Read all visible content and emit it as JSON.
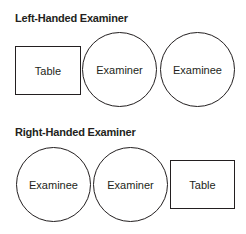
{
  "sections": [
    {
      "title": "Left-Handed Examiner",
      "items": [
        {
          "label": "Table",
          "shape": "rectangle"
        },
        {
          "label": "Examiner",
          "shape": "circle"
        },
        {
          "label": "Examinee",
          "shape": "circle"
        }
      ]
    },
    {
      "title": "Right-Handed Examiner",
      "items": [
        {
          "label": "Examinee",
          "shape": "circle"
        },
        {
          "label": "Examiner",
          "shape": "circle"
        },
        {
          "label": "Table",
          "shape": "rectangle"
        }
      ]
    }
  ],
  "colors": {
    "stroke": "#231f20",
    "background": "#ffffff"
  }
}
